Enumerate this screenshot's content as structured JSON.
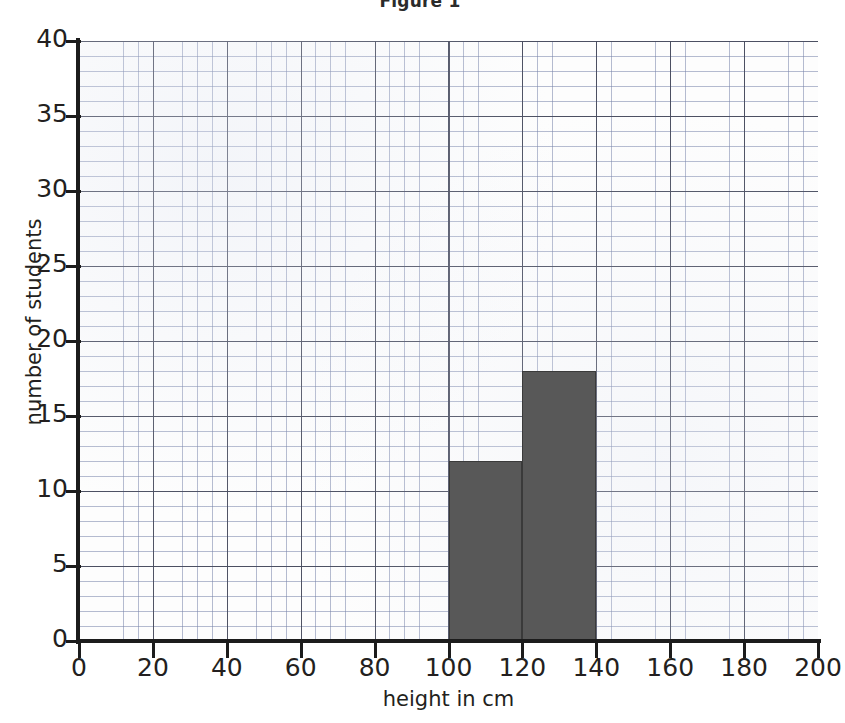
{
  "chart_data": {
    "type": "bar",
    "title": "Figure 1",
    "xlabel": "height in cm",
    "ylabel": "number of students",
    "xlim": [
      0,
      200
    ],
    "ylim": [
      0,
      40
    ],
    "x_ticks": [
      0,
      20,
      40,
      60,
      80,
      100,
      120,
      140,
      160,
      180,
      200
    ],
    "y_ticks": [
      0,
      5,
      10,
      15,
      20,
      25,
      30,
      35,
      40
    ],
    "x_tick_labels": [
      "0",
      "20",
      "40",
      "60",
      "80",
      "100",
      "120",
      "140",
      "160",
      "180",
      "200"
    ],
    "y_tick_labels": [
      "0",
      "5",
      "10",
      "15",
      "20",
      "25",
      "30",
      "35",
      "40"
    ],
    "grid": true,
    "grid_style": "graph-paper",
    "grid_minor_step_x": 4,
    "grid_minor_step_y": 1,
    "grid_major_step_x": 20,
    "grid_major_step_y": 5,
    "legend": null,
    "bar_color": "#585858",
    "bar_edge_color": "#3a3a3a",
    "grid_color": "#7884aa",
    "axis_color": "#1c1c1c",
    "bars": [
      {
        "label": "100-120",
        "x_start": 100,
        "x_end": 120,
        "value": 12
      },
      {
        "label": "120-140",
        "x_start": 120,
        "x_end": 140,
        "value": 18
      }
    ],
    "categories": [
      "100-120",
      "120-140"
    ],
    "values": [
      12,
      18
    ]
  },
  "figure": {
    "title": "Figure 1"
  }
}
